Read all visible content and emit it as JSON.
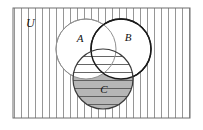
{
  "figure": {
    "type": "venn-diagram",
    "title": "",
    "universe": {
      "label": "U",
      "shape": "rectangle",
      "fill": "vertical-hatch",
      "hatch_color": "#8a8a8a",
      "hatch_spacing_px": 7,
      "border_color": "#6e6e6e",
      "x": 13,
      "y": 8,
      "width": 177,
      "height": 110
    },
    "sets": [
      {
        "id": "A",
        "label": "A",
        "shape": "circle",
        "cx": 86,
        "cy": 49,
        "r": 30,
        "fill": "#ffffff",
        "stroke": "#909090",
        "stroke_width": 1,
        "label_x": 80,
        "label_y": 40
      },
      {
        "id": "B",
        "label": "B",
        "shape": "circle",
        "cx": 121,
        "cy": 49,
        "r": 30,
        "fill": "#ffffff",
        "stroke": "#1a1a1a",
        "stroke_width": 1.4,
        "label_x": 128,
        "label_y": 41
      },
      {
        "id": "C",
        "label": "C",
        "shape": "circle",
        "cx": 103,
        "cy": 79,
        "r": 30,
        "fill": "horizontal-hatch",
        "hatch_color": "#555555",
        "hatch_spacing_px": 8,
        "shaded_fill": "#b6b6b6",
        "stroke": "#3a3a3a",
        "stroke_width": 1.2,
        "label_x": 103,
        "label_y": 92
      }
    ],
    "shaded_region": {
      "description": "C minus (A union B)",
      "color": "#b6b6b6"
    },
    "labels": {
      "universe": "U",
      "set_a": "A",
      "set_b": "B",
      "set_c": "C"
    },
    "colors": {
      "background": "#ffffff",
      "hatch": "#8a8a8a",
      "shade": "#b6b6b6",
      "border": "#6e6e6e",
      "ink": "#111111"
    }
  }
}
